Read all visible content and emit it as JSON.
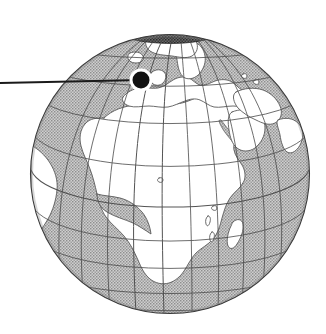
{
  "figure": {
    "kind": "globe-locator-map",
    "width": 326,
    "height": 334,
    "background_color": "#ffffff"
  },
  "globe": {
    "name": "earth-globe",
    "projection": "orthographic",
    "center_x": 170,
    "center_y": 174,
    "radius": 140,
    "center_longitude": 20,
    "center_latitude": 18,
    "outline_color": "#3a3a3a",
    "outline_width": 1.1,
    "ocean_fill_color": "#a8a8a8",
    "ocean_pattern": "stipple-halftone",
    "land_fill_color": "#ffffff",
    "coastline_color": "#555555",
    "polar_cap_color": "#2b2b2b",
    "visible_landmasses": [
      "Africa",
      "Europe",
      "Greenland",
      "Arabian Peninsula",
      "Madagascar",
      "Iceland",
      "British Isles",
      "Scandinavia",
      "Western Asia",
      "South America (eastern edge)"
    ],
    "visible_waters": [
      "Atlantic Ocean",
      "Mediterranean Sea",
      "Indian Ocean",
      "Black Sea",
      "Caspian Sea",
      "Red Sea",
      "Arctic Ocean"
    ]
  },
  "graticule": {
    "name": "lat-lon-grid",
    "line_color": "#4a4a4a",
    "line_width": 0.85,
    "meridian_step_degrees": 20,
    "parallel_step_degrees": 20,
    "meridians": [
      -160,
      -140,
      -120,
      -100,
      -80,
      -60,
      -40,
      -20,
      0,
      20,
      40,
      60,
      80,
      100,
      120,
      140,
      160,
      180
    ],
    "parallels": [
      -80,
      -60,
      -40,
      -20,
      0,
      20,
      40,
      60,
      80
    ]
  },
  "marker": {
    "name": "location-marker",
    "center_x": 141,
    "center_y": 80,
    "dot_radius": 8.5,
    "halo_radius": 11.5,
    "dot_color": "#111111",
    "halo_color": "#ffffff",
    "approx_longitude": -9,
    "approx_latitude": 53
  },
  "pointer": {
    "name": "leader-line",
    "x1": 0,
    "y1": 83,
    "x2": 141,
    "y2": 80,
    "color": "#1a1a1a",
    "width": 2.0
  },
  "labels": {
    "alt_text": "Shaded-relief style globe showing Africa and Europe with a black circular marker in the North Atlantic near Ireland, connected by a horizontal leader line running off the left edge of the frame."
  }
}
